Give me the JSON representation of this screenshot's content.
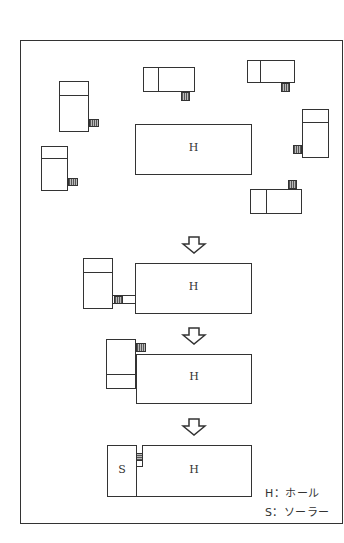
{
  "diagram": {
    "title": "",
    "stages": [
      {
        "name": "scattered",
        "hall_label": "H"
      },
      {
        "name": "approach",
        "hall_label": "H"
      },
      {
        "name": "attach",
        "hall_label": "H"
      },
      {
        "name": "docked",
        "hall_label": "H",
        "solar_label": "S"
      }
    ],
    "legend": [
      {
        "key": "H",
        "sep": "：",
        "text": "ホール"
      },
      {
        "key": "S",
        "sep": "：",
        "text": "ソーラー"
      }
    ],
    "legend_lines": [
      "H：ホール",
      "S：ソーラー"
    ],
    "arrow_icon": "down-outline-arrow",
    "colors": {
      "line": "#333333",
      "background": "#ffffff",
      "hatch": "#555555"
    }
  }
}
